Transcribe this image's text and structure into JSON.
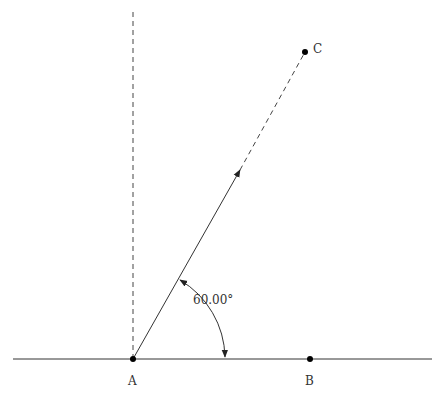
{
  "diagram": {
    "type": "geometry-angle-construction",
    "points": {
      "A": {
        "label": "A",
        "x": 133,
        "y": 359
      },
      "B": {
        "label": "B",
        "x": 310,
        "y": 359
      },
      "C": {
        "label": "C",
        "x": 305,
        "y": 52
      }
    },
    "angle": {
      "label": "60.00°",
      "vertex": "A",
      "from": "AB",
      "to": "AC",
      "value_deg": 60.0
    },
    "lines": [
      {
        "name": "baseline",
        "style": "solid"
      },
      {
        "name": "vertical-through-A",
        "style": "dashed"
      },
      {
        "name": "ray-A-to-arrow",
        "style": "solid"
      },
      {
        "name": "extension-to-C",
        "style": "dashed"
      }
    ],
    "colors": {
      "line": "#333333",
      "point": "#000000",
      "background": "#ffffff"
    }
  }
}
